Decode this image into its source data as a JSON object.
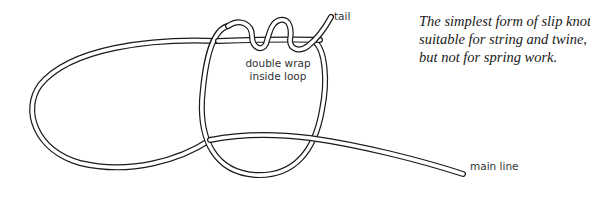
{
  "diagram": {
    "title": "Slip knot",
    "caption_lines": [
      "The simplest form of slip knot –",
      "suitable for string and twine,",
      "but not for spring work."
    ],
    "labels": {
      "tail": "tail",
      "double_wrap_line1": "double wrap",
      "double_wrap_line2": "inside loop",
      "main_line": "main line"
    },
    "colors": {
      "rope_outline": "#1a1a1a",
      "rope_fill": "#ffffff",
      "label_text": "#333333",
      "caption_text": "#1a1a1a",
      "background": "#ffffff"
    }
  }
}
